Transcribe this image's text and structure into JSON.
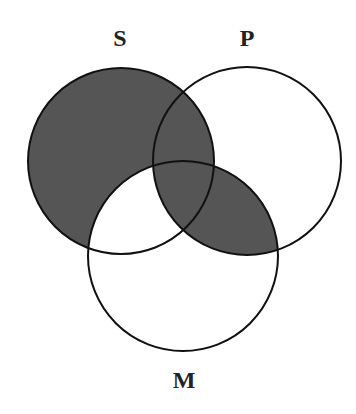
{
  "diagram": {
    "type": "venn-3",
    "labels": {
      "s": "S",
      "p": "P",
      "m": "M"
    },
    "circles": [
      {
        "id": "S",
        "cx": 121,
        "cy": 161,
        "r": 93
      },
      {
        "id": "P",
        "cx": 247,
        "cy": 161,
        "r": 94
      },
      {
        "id": "M",
        "cx": 183,
        "cy": 256,
        "r": 95
      }
    ],
    "shaded_regions": [
      "S only",
      "S∩P not M",
      "S∩P∩M",
      "P∩M not S"
    ],
    "unshaded_regions": [
      "P only",
      "M only",
      "S∩M not P"
    ],
    "colors": {
      "shade": "#555555",
      "stroke": "#111111",
      "background": "#ffffff"
    }
  }
}
